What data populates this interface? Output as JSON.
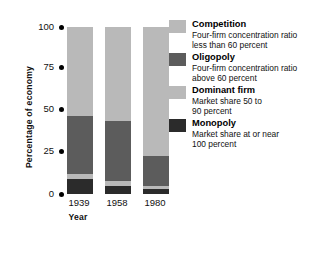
{
  "chart_data": {
    "type": "bar",
    "subtype": "stacked-column",
    "title": "",
    "xlabel": "Year",
    "ylabel": "Percentage of economy",
    "categories": [
      "1939",
      "1958",
      "1980"
    ],
    "ylim": [
      0,
      100
    ],
    "yticks": [
      0,
      25,
      50,
      75,
      100
    ],
    "ytick_labels": [
      "0",
      "25",
      "50",
      "75",
      "100"
    ],
    "grid": false,
    "legend_position": "right",
    "stack_order_bottom_to_top": [
      "Monopoly",
      "Dominant firm",
      "Oligopoly",
      "Competition"
    ],
    "series": [
      {
        "name": "Competition",
        "color": "#b9b9b9",
        "values": [
          53,
          56,
          77
        ]
      },
      {
        "name": "Oligopoly",
        "color": "#5c5c5c",
        "values": [
          35,
          36,
          18
        ]
      },
      {
        "name": "Dominant firm",
        "color": "#b9b9b9",
        "values": [
          3,
          3,
          2
        ]
      },
      {
        "name": "Monopoly",
        "color": "#2b2b2b",
        "values": [
          9,
          5,
          3
        ]
      }
    ]
  },
  "axes": {
    "y_title": "Percentage of economy",
    "x_title": "Year",
    "y_ticks": [
      {
        "label": "100",
        "value": 100
      },
      {
        "label": "75",
        "value": 75
      },
      {
        "label": "50",
        "value": 50
      },
      {
        "label": "25",
        "value": 25
      },
      {
        "label": "0",
        "value": 0
      }
    ],
    "x_ticks": [
      {
        "label": "1939"
      },
      {
        "label": "1958"
      },
      {
        "label": "1980"
      }
    ]
  },
  "legend": {
    "items": [
      {
        "title": "Competition",
        "desc_line1": "Four-firm concentration ratio",
        "desc_line2": "less than 60 percent",
        "color": "#b9b9b9"
      },
      {
        "title": "Oligopoly",
        "desc_line1": "Four-firm concentration ratio",
        "desc_line2": "above 60 percent",
        "color": "#5c5c5c"
      },
      {
        "title": "Dominant firm",
        "desc_line1": "Market share 50 to",
        "desc_line2": "90 percent",
        "color": "#b9b9b9"
      },
      {
        "title": "Monopoly",
        "desc_line1": "Market share at or near",
        "desc_line2": "100 percent",
        "color": "#2b2b2b"
      }
    ]
  },
  "colors": {
    "competition": "#b9b9b9",
    "oligopoly": "#5c5c5c",
    "dominant_firm": "#b9b9b9",
    "monopoly": "#2b2b2b",
    "background": "#ffffff",
    "text": "#111111"
  }
}
